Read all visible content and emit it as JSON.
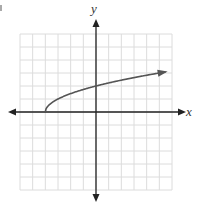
{
  "chart_data": {
    "type": "line",
    "title": "",
    "xlabel": "x",
    "ylabel": "y",
    "xlim": [
      -6,
      6
    ],
    "ylim": [
      -6,
      6
    ],
    "grid": true,
    "grid_step": 1,
    "legend": null,
    "series": [
      {
        "name": "y = sqrt(x + 4)",
        "x": [
          -4,
          -3.5,
          -3,
          -2,
          -1,
          0,
          1,
          2,
          3,
          4,
          5,
          5.5
        ],
        "y": [
          0,
          0.71,
          1,
          1.41,
          1.73,
          2,
          2.24,
          2.45,
          2.65,
          2.83,
          3,
          3.08
        ],
        "start_point": [
          -4,
          0
        ],
        "end_arrow": true,
        "color": "#555555"
      }
    ],
    "axes": {
      "x_arrows": "both",
      "y_arrows": "both",
      "tick_labels": false
    }
  },
  "labels": {
    "x": "x",
    "y": "y"
  },
  "colors": {
    "grid": "#dcdcdc",
    "axis": "#222222",
    "curve": "#555555"
  }
}
